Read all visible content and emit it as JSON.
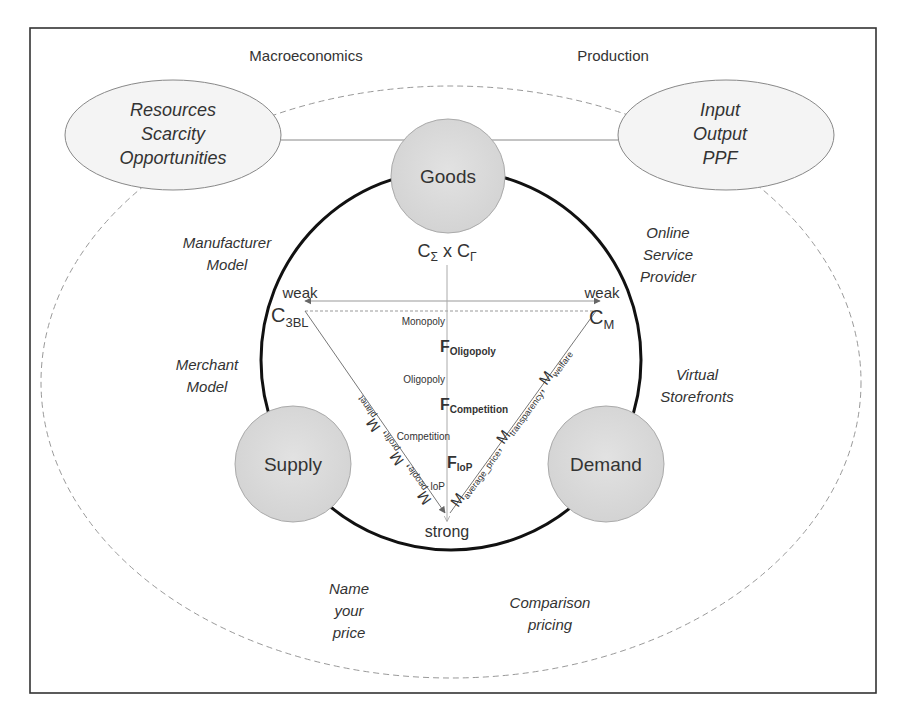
{
  "diagram": {
    "top_labels": {
      "left": "Macroeconomics",
      "right": "Production"
    },
    "left_ellipse": {
      "lines": [
        "Resources",
        "Scarcity",
        "Opportunities"
      ]
    },
    "right_ellipse": {
      "lines": [
        "Input",
        "Output",
        "PPF"
      ]
    },
    "nodes": {
      "goods": "Goods",
      "supply": "Supply",
      "demand": "Demand"
    },
    "top_formula": {
      "c1": "C",
      "c1_sub": "Σ",
      "times": " x ",
      "c2": "C",
      "c2_sub": "Γ"
    },
    "corners": {
      "left": {
        "base": "C",
        "sub": "3BL"
      },
      "right": {
        "base": "C",
        "sub": "M"
      },
      "bottom": "strong",
      "weak_left": "weak",
      "weak_right": "weak"
    },
    "axis_labels": {
      "monopoly": "Monopoly",
      "oligopoly": "Oligopoly",
      "competition": "Competition",
      "lop": "loP"
    },
    "forces": [
      {
        "base": "F",
        "sub": "Oligopoly"
      },
      {
        "base": "F",
        "sub": "Competition"
      },
      {
        "base": "F",
        "sub": "loP"
      }
    ],
    "left_edge_metrics": {
      "text": "M",
      "items": [
        {
          "base": "M",
          "sub": "people"
        },
        {
          "base": "M",
          "sub": "profit"
        },
        {
          "base": "M",
          "sub": "planet"
        }
      ]
    },
    "right_edge_metrics": {
      "items": [
        {
          "base": "M",
          "sub": "average_price"
        },
        {
          "base": "M",
          "sub": "transparency"
        },
        {
          "base": "M",
          "sub": "welfare"
        }
      ]
    },
    "business_models": {
      "manufacturer": [
        "Manufacturer",
        "Model"
      ],
      "merchant": [
        "Merchant",
        "Model"
      ],
      "online_service": [
        "Online",
        "Service",
        "Provider"
      ],
      "virtual_storefronts": [
        "Virtual",
        "Storefronts"
      ],
      "name_your_price": [
        "Name",
        "your",
        "price"
      ],
      "comparison_pricing": [
        "Comparison",
        "pricing"
      ]
    },
    "colors": {
      "node_fill": "#dcdcdc",
      "node_stroke": "#aaaaaa",
      "ellipse_fill": "#f4f4f4",
      "circle_stroke": "#111111",
      "frame_stroke": "#333333",
      "dashed_stroke": "#999999",
      "text": "#333333"
    }
  }
}
